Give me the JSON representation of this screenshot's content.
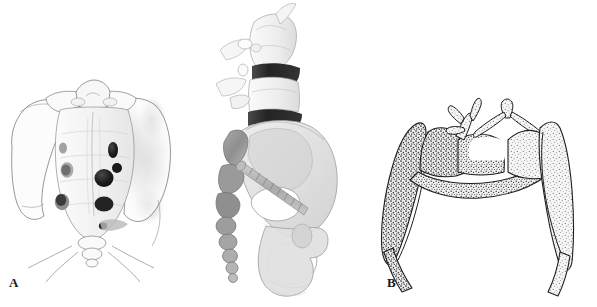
{
  "figure": {
    "kind": "anatomical-illustration",
    "background_color": "#ffffff",
    "width_px": 597,
    "height_px": 307,
    "panel_count": 3
  },
  "panels": [
    {
      "id": "a",
      "label": "A",
      "view": "anterior view of sacrum and pelvis with sacral foramina and right-sided shaded lesion",
      "ink_color": "#3c3c3c",
      "shadow_color": "#8a8a8a",
      "foramen_color": "#1e1e1e"
    },
    {
      "id": "b",
      "label": "B",
      "view": "lateral oblique view of lumbosacral spine and hemipelvis with iliosacral screw",
      "ink_color": "#6e6e6e",
      "disc_color": "#2b2b2b",
      "bone_fill": "#e3e3e3"
    },
    {
      "id": "c",
      "label": "C",
      "view": "axial cross-section of sacrum showing trabecular bone, sacral canal and iliac wings",
      "ink_color": "#2a2a2a",
      "dense_trabecular_color": "#4a4a4a",
      "light_trabecular_color": "#8e8e8e"
    }
  ],
  "labels": {
    "a": "A",
    "b": "B",
    "c": "C"
  }
}
